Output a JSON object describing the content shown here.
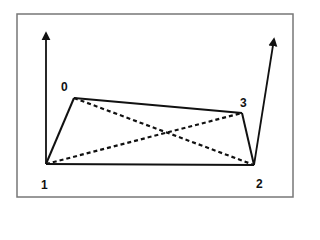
{
  "diagram": {
    "type": "quadrilateral-with-diagonals",
    "frame": {
      "x": 17,
      "y": 14,
      "width": 276,
      "height": 183,
      "stroke": "#777777"
    },
    "stroke_color": "#111111",
    "vertices": [
      {
        "id": "0",
        "label": "0",
        "x": 74,
        "y": 98,
        "label_x": 61,
        "label_y": 81
      },
      {
        "id": "1",
        "label": "1",
        "x": 46,
        "y": 164,
        "label_x": 41,
        "label_y": 179
      },
      {
        "id": "2",
        "label": "2",
        "x": 254,
        "y": 165,
        "label_x": 256,
        "label_y": 178
      },
      {
        "id": "3",
        "label": "3",
        "x": 242,
        "y": 113,
        "label_x": 240,
        "label_y": 97
      }
    ],
    "solid_edges": [
      [
        "1",
        "0"
      ],
      [
        "0",
        "3"
      ],
      [
        "3",
        "2"
      ],
      [
        "1",
        "2"
      ]
    ],
    "dashed_edges": [
      [
        "0",
        "2"
      ],
      [
        "1",
        "3"
      ]
    ],
    "arrows": [
      {
        "name": "left-vertical-arrow",
        "from": [
          46,
          164
        ],
        "to": [
          46,
          33
        ]
      },
      {
        "name": "right-slanted-arrow",
        "from": [
          254,
          165
        ],
        "to": [
          274,
          39
        ]
      }
    ]
  }
}
